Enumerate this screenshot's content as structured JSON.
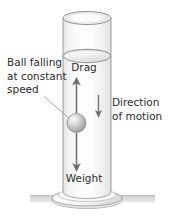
{
  "figure": {
    "width": 169,
    "height": 222,
    "background_color": "#ffffff"
  },
  "labels": {
    "ball_callout": {
      "line1": "Ball falling",
      "line2": "at constant",
      "line3": "speed"
    },
    "drag": "Drag",
    "weight": "Weight",
    "direction": {
      "line1": "Direction",
      "line2": "of motion"
    }
  },
  "colors": {
    "text": "#2b2b2b",
    "outline": "#8f8f8f",
    "arrow": "#6e6e6e",
    "leader_line": "#a8a8a8",
    "cylinder_fill": "#fbfbfb",
    "cylinder_shade": "#e8e8e8",
    "ball_light": "#f2f2f2",
    "ball_dark": "#9a9a9a",
    "ground": "#d6d6d6",
    "base_fill": "#f4f4f4"
  },
  "elements": {
    "cylinder": "measuring-cylinder",
    "liquid_surface": "liquid-surface-ellipse",
    "ball": "falling-ball",
    "drag_arrow": "drag-force-arrow-up",
    "weight_arrow": "weight-force-arrow-down",
    "motion_arrow": "direction-of-motion-arrow-down",
    "leader": "ball-callout-leader-line",
    "base": "cylinder-base",
    "ground": "ground-line"
  }
}
